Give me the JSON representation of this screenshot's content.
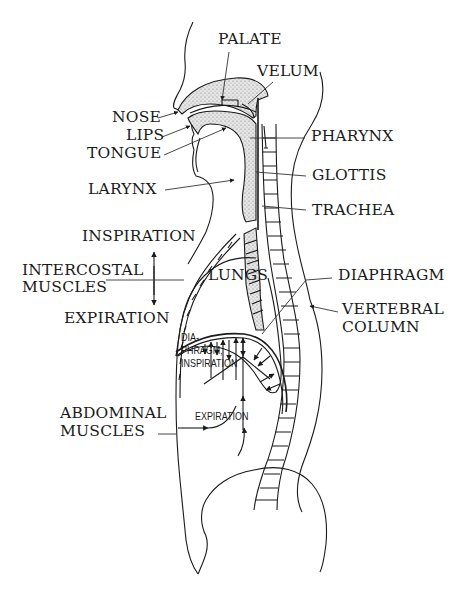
{
  "diagram": {
    "labels": {
      "palate": "PALATE",
      "velum": "VELUM",
      "nose": "NOSE",
      "lips": "LIPS",
      "tongue": "TONGUE",
      "pharynx": "PHARYNX",
      "larynx": "LARYNX",
      "glottis": "GLOTTIS",
      "trachea": "TRACHEA",
      "inspiration": "INSPIRATION",
      "intercostal_line1": "INTERCOSTAL",
      "intercostal_line2": "MUSCLES",
      "lungs": "LUNGS",
      "diaphragm": "DIAPHRAGM",
      "expiration": "EXPIRATION",
      "vertebral_line1": "VERTEBRAL",
      "vertebral_line2": "COLUMN",
      "dia_line1": "DIA-",
      "dia_line2": "PHRAGM,",
      "dia_line3": "INSPIRATION",
      "abdominal_line1": "ABDOMINAL",
      "abdominal_line2": "MUSCLES",
      "abdominal_expiration": "EXPIRATION"
    },
    "colors": {
      "line": "#1a1a1a",
      "stipple_fill": "#d8d8d8",
      "background": "#ffffff"
    }
  }
}
